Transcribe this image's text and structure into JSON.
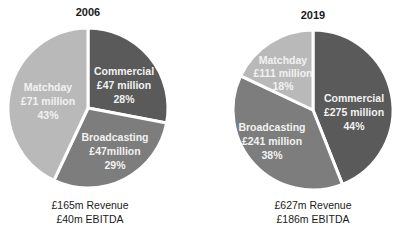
{
  "chart_data": [
    {
      "type": "pie",
      "title": "2006",
      "slices": [
        {
          "label": "Commercial",
          "value_text": "£47 million",
          "value": 47,
          "percent": 28,
          "percent_text": "28%",
          "color": "#5a5a5a"
        },
        {
          "label": "Broadcasting",
          "value_text": "£47million",
          "value": 47,
          "percent": 29,
          "percent_text": "29%",
          "color": "#7d7d7d"
        },
        {
          "label": "Matchday",
          "value_text": "£71 million",
          "value": 71,
          "percent": 43,
          "percent_text": "43%",
          "color": "#b9b9b9"
        }
      ],
      "footer": [
        "£165m Revenue",
        "£40m EBITDA"
      ],
      "revenue_m": 165,
      "ebitda_m": 40
    },
    {
      "type": "pie",
      "title": "2019",
      "slices": [
        {
          "label": "Commercial",
          "value_text": "£275 million",
          "value": 275,
          "percent": 44,
          "percent_text": "44%",
          "color": "#5a5a5a"
        },
        {
          "label": "Broadcasting",
          "value_text": "£241 million",
          "value": 241,
          "percent": 38,
          "percent_text": "38%",
          "color": "#7d7d7d"
        },
        {
          "label": "Matchday",
          "value_text": "£111 million",
          "value": 111,
          "percent": 18,
          "percent_text": "18%",
          "color": "#b9b9b9"
        }
      ],
      "footer": [
        "£627m Revenue",
        "£186m EBITDA"
      ],
      "revenue_m": 627,
      "ebitda_m": 186
    }
  ]
}
